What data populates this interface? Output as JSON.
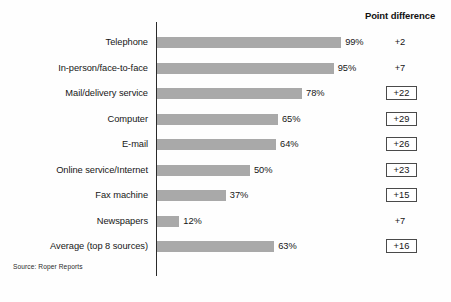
{
  "header": {
    "point_difference_label": "Point difference"
  },
  "source": {
    "text": "Source: Roper Reports"
  },
  "colors": {
    "bar": "#a9a9a9",
    "axis": "#2a2a2a",
    "box_border": "#4a4a4a",
    "background": "#fefefe",
    "text": "#161616"
  },
  "chart_data": {
    "type": "bar",
    "orientation": "horizontal",
    "title": "",
    "subtitle": "",
    "xlabel": "",
    "ylabel": "",
    "xlim": [
      0,
      100
    ],
    "grid": false,
    "legend": false,
    "source": "Source: Roper Reports",
    "extra_column_header": "Point difference",
    "categories": [
      "Telephone",
      "In-person/face-to-face",
      "Mail/delivery service",
      "Computer",
      "E-mail",
      "Online service/Internet",
      "Fax machine",
      "Newspapers",
      "Average (top 8 sources)"
    ],
    "values": [
      99,
      95,
      78,
      65,
      64,
      50,
      37,
      12,
      63
    ],
    "value_labels": [
      "99%",
      "95%",
      "78%",
      "65%",
      "64%",
      "50%",
      "37%",
      "12%",
      "63%"
    ],
    "point_difference": [
      "+2",
      "+7",
      "+22",
      "+29",
      "+26",
      "+23",
      "+15",
      "+7",
      "+16"
    ],
    "point_difference_boxed": [
      false,
      false,
      true,
      true,
      true,
      true,
      true,
      false,
      true
    ]
  },
  "rows": [
    {
      "label": "Telephone",
      "value": 99,
      "value_label": "99%",
      "diff": "+2",
      "boxed": false
    },
    {
      "label": "In-person/face-to-face",
      "value": 95,
      "value_label": "95%",
      "diff": "+7",
      "boxed": false
    },
    {
      "label": "Mail/delivery service",
      "value": 78,
      "value_label": "78%",
      "diff": "+22",
      "boxed": true
    },
    {
      "label": "Computer",
      "value": 65,
      "value_label": "65%",
      "diff": "+29",
      "boxed": true
    },
    {
      "label": "E-mail",
      "value": 64,
      "value_label": "64%",
      "diff": "+26",
      "boxed": true
    },
    {
      "label": "Online service/Internet",
      "value": 50,
      "value_label": "50%",
      "diff": "+23",
      "boxed": true
    },
    {
      "label": "Fax machine",
      "value": 37,
      "value_label": "37%",
      "diff": "+15",
      "boxed": true
    },
    {
      "label": "Newspapers",
      "value": 12,
      "value_label": "12%",
      "diff": "+7",
      "boxed": false
    },
    {
      "label": "Average (top 8 sources)",
      "value": 63,
      "value_label": "63%",
      "diff": "+16",
      "boxed": true
    }
  ]
}
